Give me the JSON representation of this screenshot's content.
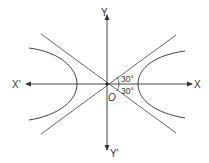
{
  "figure": {
    "type": "hyperbola with asymptotes",
    "labels": {
      "x_positive": "X",
      "x_negative": "X'",
      "y_positive": "Y",
      "y_negative": "Y'",
      "origin": "O",
      "angle_upper": "30°",
      "angle_lower": "30°"
    },
    "colors": {
      "line": "#444444",
      "text": "#333333",
      "background": "#ffffff"
    }
  }
}
